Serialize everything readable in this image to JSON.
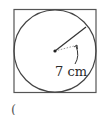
{
  "figure": {
    "radius_label": "7 cm",
    "stray_mark": "(",
    "colors": {
      "stroke": "#3a3a3a",
      "dotted": "#9a9a9a",
      "text": "#2a2a2a"
    }
  }
}
